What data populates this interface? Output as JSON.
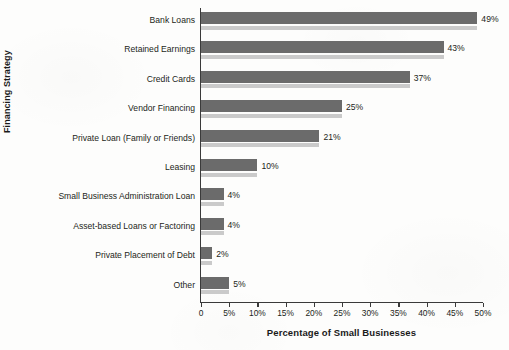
{
  "chart_data": {
    "type": "bar",
    "orientation": "horizontal",
    "title": "",
    "xlabel": "Percentage of Small Businesses",
    "ylabel": "Financing Strategy",
    "xlim": [
      0,
      50
    ],
    "grid": false,
    "legend": null,
    "categories": [
      "Bank Loans",
      "Retained Earnings",
      "Credit Cards",
      "Vendor Financing",
      "Private Loan (Family or Friends)",
      "Leasing",
      "Small Business  Administration Loan",
      "Asset-based Loans or Factoring",
      "Private Placement of Debt",
      "Other"
    ],
    "values": [
      49,
      43,
      37,
      25,
      21,
      10,
      4,
      4,
      2,
      5
    ],
    "value_labels": [
      "49%",
      "43%",
      "37%",
      "25%",
      "21%",
      "10%",
      "4%",
      "4%",
      "2%",
      "5%"
    ],
    "xticks": [
      0,
      5,
      10,
      15,
      20,
      25,
      30,
      35,
      40,
      45,
      50
    ],
    "xtick_labels": [
      "0",
      "5%",
      "10%",
      "15%",
      "20%",
      "25%",
      "30%",
      "35%",
      "40%",
      "45%",
      "50%"
    ],
    "colors": {
      "bar": "#6b6b6b",
      "bar_shadow": "#cacaca",
      "axis": "#3a3a3a",
      "text": "#231f20",
      "background": "#fdfdfc"
    }
  }
}
